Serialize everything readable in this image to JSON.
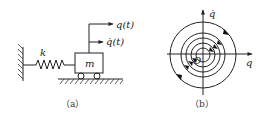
{
  "panel_a": {
    "caption": "（a）",
    "spring_label": "k",
    "mass_label": "m",
    "displacement_label": "q(t)",
    "velocity_label": "q̇(t)"
  },
  "panel_b": {
    "caption": "（b）",
    "x_axis_label": "q",
    "y_axis_label": "q̇",
    "origin_label": "O",
    "orbit_count": 5
  }
}
